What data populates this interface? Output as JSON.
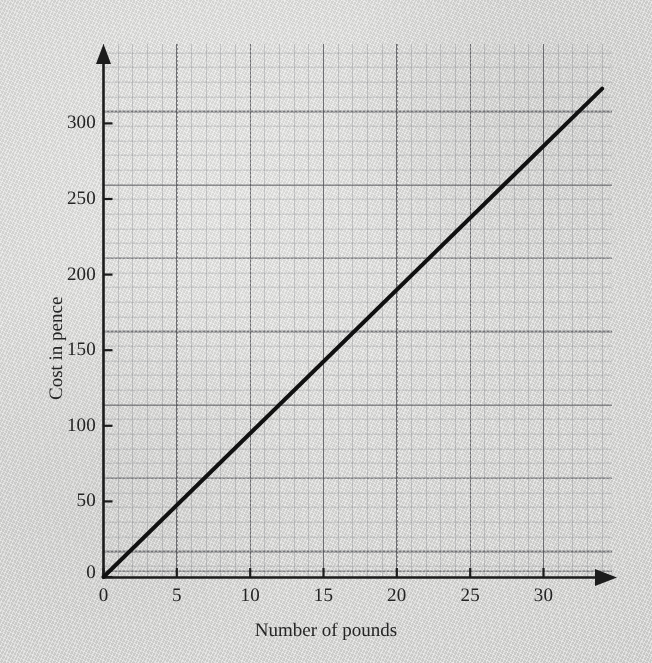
{
  "chart_data": {
    "type": "line",
    "title": "",
    "subtitle": "",
    "xlabel": "Number of pounds",
    "ylabel": "Cost in pence",
    "xlim": [
      0,
      34.7
    ],
    "ylim": [
      0,
      363
    ],
    "xticks": [
      0,
      5,
      10,
      15,
      20,
      25,
      30
    ],
    "xticklabels": [
      "0",
      "5",
      "10",
      "15",
      "20",
      "25",
      "30"
    ],
    "yticks": [
      0,
      50,
      100,
      150,
      200,
      250,
      300
    ],
    "yticklabels": [
      "0",
      "50",
      "100",
      "150",
      "200",
      "250",
      "300"
    ],
    "grid": true,
    "grid_minor_step_x": 1,
    "grid_minor_step_y": 10,
    "grid_major_step_x": 5,
    "grid_major_step_y": 50,
    "legend": null,
    "legend_position": "none",
    "series": [
      {
        "name": "Cost of pounds",
        "color": "#111111",
        "x": [
          0,
          5,
          10,
          15,
          20,
          25,
          30,
          34
        ],
        "y": [
          0,
          47,
          95,
          142,
          190,
          237,
          285,
          323
        ],
        "slope_pence_per_pound": 9.5,
        "intercept": 0,
        "annotations": []
      }
    ],
    "axis_style": {
      "x_axis_arrow": true,
      "y_axis_arrow": true,
      "origin_label": "0",
      "axis_color": "#1c1c1c"
    }
  },
  "figure": {
    "background_color": "#d8d8d6",
    "paper_texture": true,
    "grid_color": "#5a5a5f",
    "minor_grid_color": "#787a80",
    "ink_color": "#111111"
  },
  "labels": {
    "x_axis_title": "Number of pounds",
    "y_axis_title": "Cost in pence",
    "x_ticks": [
      "0",
      "5",
      "10",
      "15",
      "20",
      "25",
      "30"
    ],
    "y_ticks": [
      "0",
      "50",
      "100",
      "150",
      "200",
      "250",
      "300"
    ],
    "origin": "0"
  }
}
